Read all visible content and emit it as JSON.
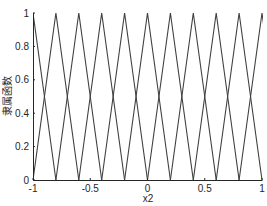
{
  "chart_data": {
    "type": "line",
    "title": "",
    "xlabel": "x2",
    "ylabel": "隶属函数",
    "xlim": [
      -1,
      1
    ],
    "ylim": [
      0,
      1
    ],
    "xticks": [
      -1,
      -0.5,
      0,
      0.5,
      1
    ],
    "xtick_labels": [
      "-1",
      "-0.5",
      "0",
      "0.5",
      "1"
    ],
    "yticks": [
      0,
      0.2,
      0.4,
      0.6,
      0.8,
      1
    ],
    "ytick_labels": [
      "0",
      "0.2",
      "0.4",
      "0.6",
      "0.8",
      "1"
    ],
    "grid": false,
    "legend": null,
    "line_color": "#404040",
    "series": [
      {
        "name": "mf1",
        "x": [
          -1.2,
          -1.0,
          -0.8
        ],
        "y": [
          0,
          1,
          0
        ]
      },
      {
        "name": "mf2",
        "x": [
          -1.0,
          -0.8,
          -0.6
        ],
        "y": [
          0,
          1,
          0
        ]
      },
      {
        "name": "mf3",
        "x": [
          -0.8,
          -0.6,
          -0.4
        ],
        "y": [
          0,
          1,
          0
        ]
      },
      {
        "name": "mf4",
        "x": [
          -0.6,
          -0.4,
          -0.2
        ],
        "y": [
          0,
          1,
          0
        ]
      },
      {
        "name": "mf5",
        "x": [
          -0.4,
          -0.2,
          0.0
        ],
        "y": [
          0,
          1,
          0
        ]
      },
      {
        "name": "mf6",
        "x": [
          -0.2,
          0.0,
          0.2
        ],
        "y": [
          0,
          1,
          0
        ]
      },
      {
        "name": "mf7",
        "x": [
          0.0,
          0.2,
          0.4
        ],
        "y": [
          0,
          1,
          0
        ]
      },
      {
        "name": "mf8",
        "x": [
          0.2,
          0.4,
          0.6
        ],
        "y": [
          0,
          1,
          0
        ]
      },
      {
        "name": "mf9",
        "x": [
          0.4,
          0.6,
          0.8
        ],
        "y": [
          0,
          1,
          0
        ]
      },
      {
        "name": "mf10",
        "x": [
          0.6,
          0.8,
          1.0
        ],
        "y": [
          0,
          1,
          0
        ]
      },
      {
        "name": "mf11",
        "x": [
          0.8,
          1.0,
          1.2
        ],
        "y": [
          0,
          1,
          0
        ]
      }
    ]
  }
}
